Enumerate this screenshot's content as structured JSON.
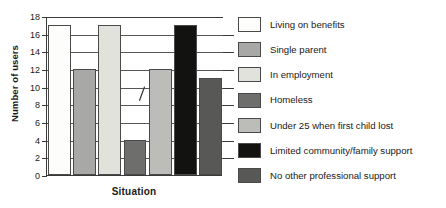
{
  "chart_data": {
    "type": "bar",
    "title": "",
    "xlabel": "Situation",
    "ylabel": "Number of users",
    "ylim": [
      0,
      18
    ],
    "ytick_step": 2,
    "yticks": [
      "0",
      "2",
      "4",
      "6",
      "8",
      "10",
      "12",
      "14",
      "16",
      "18"
    ],
    "grid": true,
    "legend_position": "right",
    "categories": [
      "Living on benefits",
      "Single parent",
      "In employment",
      "Homeless",
      "Under 25 when first child lost",
      "Limited community/family support",
      "No other professional support"
    ],
    "values": [
      17,
      12,
      17,
      4,
      12,
      17,
      11
    ],
    "colors": [
      "#fdfdfc",
      "#a8a8a6",
      "#e2e2dd",
      "#6e6e6c",
      "#bcbcb8",
      "#121210",
      "#585856"
    ],
    "annotations": [
      {
        "name": "handwritten-slash-mark",
        "x_category": "Homeless",
        "y_value": 9
      }
    ]
  },
  "legend": {
    "items": [
      {
        "label": "Living on benefits",
        "fill": "#fdfdfc",
        "swatch_class": "f-white"
      },
      {
        "label": "Single parent",
        "fill": "#a8a8a6",
        "swatch_class": "f-mid"
      },
      {
        "label": "In employment",
        "fill": "#e2e2dd",
        "swatch_class": "f-light"
      },
      {
        "label": "Homeless",
        "fill": "#6e6e6c",
        "swatch_class": "f-dark"
      },
      {
        "label": "Under 25 when first child lost",
        "fill": "#bcbcb8",
        "swatch_class": "f-midlt"
      },
      {
        "label": "Limited community/family support",
        "fill": "#121210",
        "swatch_class": "f-black"
      },
      {
        "label": "No other professional support",
        "fill": "#585856",
        "swatch_class": "f-dkgry"
      }
    ]
  },
  "axes": {
    "y_title": "Number of users",
    "x_title": "Situation"
  }
}
